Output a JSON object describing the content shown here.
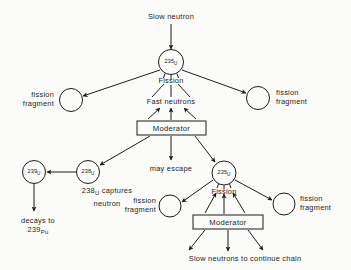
{
  "diagram": {
    "ink_color": "#1c1c1c",
    "background_color": "#fbfbf9",
    "labels": {
      "slow_neutron": "Slow neutron",
      "fission_top": "Fission",
      "fast_neutrons": "Fast neutrons",
      "moderator_top": "Moderator",
      "fission_fragment_top_left": "fission\nfragment",
      "fission_fragment_top_right": "fission\nfragment",
      "may_escape": "may escape",
      "u238_captures": "238U captures\nneutron",
      "decays_to": "decays to\n239Pu",
      "fission_bottom": "Fission",
      "moderator_bottom": "Moderator",
      "fission_fragment_bottom_left": "fission\nfragment",
      "fission_fragment_bottom_right": "fission\nfragment",
      "slow_neutrons_chain": "Slow neutrons to continue chain"
    },
    "nuclides": {
      "u235_top": {
        "mass": "235",
        "element": "U"
      },
      "u238": {
        "mass": "238",
        "element": "U"
      },
      "u239": {
        "mass": "239",
        "element": "U"
      },
      "u235_bottom": {
        "mass": "235",
        "element": "U"
      },
      "pu239": {
        "mass": "239",
        "element": "Pu"
      }
    },
    "caption_parts": {
      "u238_mass": "238",
      "u238_elem": "U",
      "u238_rest": " captures",
      "u238_line2": "neutron",
      "decays_line1": "decays to",
      "pu_mass": "239",
      "pu_elem": "Pu"
    }
  }
}
